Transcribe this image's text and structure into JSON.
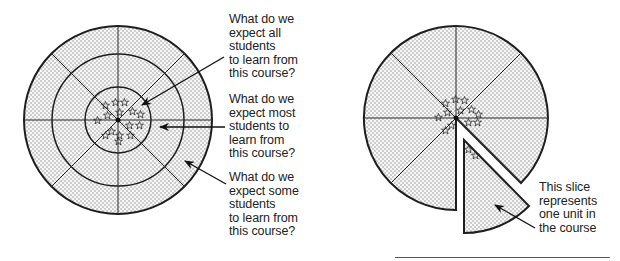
{
  "left_diagram": {
    "name": "Concentric learning-expectation target",
    "rings": [
      {
        "level": "inner",
        "label_lines": [
          "What do we",
          "expect all",
          "students",
          "to learn from",
          "this course?"
        ]
      },
      {
        "level": "middle",
        "label_lines": [
          "What do we",
          "expect most",
          "students to",
          "learn from",
          "this course?"
        ]
      },
      {
        "level": "outer",
        "label_lines": [
          "What do we",
          "expect some",
          "students",
          "to learn from",
          "this course?"
        ]
      }
    ],
    "sectors": 8,
    "stars_symbol": "☆"
  },
  "right_diagram": {
    "name": "Course pie with one slice removed",
    "sectors": 8,
    "removed_slice_label_lines": [
      "This slice",
      "represents",
      "one unit in",
      "the course"
    ]
  },
  "colors": {
    "stroke": "#1e1e1e",
    "dot": "#9a9a9a",
    "fill": "#f4f4f4"
  }
}
